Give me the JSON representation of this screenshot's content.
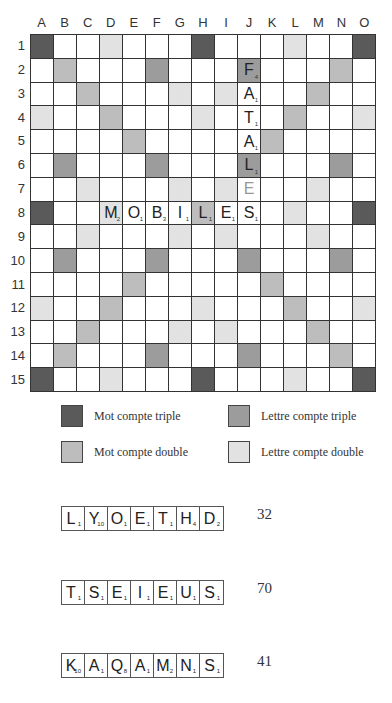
{
  "board": {
    "columns": [
      "A",
      "B",
      "C",
      "D",
      "E",
      "F",
      "G",
      "H",
      "I",
      "J",
      "K",
      "L",
      "M",
      "N",
      "O"
    ],
    "rows": [
      "1",
      "2",
      "3",
      "4",
      "5",
      "6",
      "7",
      "8",
      "9",
      "10",
      "11",
      "12",
      "13",
      "14",
      "15"
    ],
    "premiums": {
      "tw": [
        "A1",
        "H1",
        "O1",
        "A8",
        "O8",
        "A15",
        "H15",
        "O15"
      ],
      "dw": [
        "B2",
        "C3",
        "D4",
        "E5",
        "K11",
        "L12",
        "M13",
        "N14",
        "N2",
        "M3",
        "L4",
        "K5",
        "E11",
        "D12",
        "C13",
        "B14",
        "H8"
      ],
      "tl": [
        "F2",
        "J2",
        "B6",
        "F6",
        "J6",
        "N6",
        "B10",
        "F10",
        "J10",
        "N10",
        "F14",
        "J14"
      ],
      "dl": [
        "D1",
        "L1",
        "G3",
        "I3",
        "A4",
        "H4",
        "O4",
        "C7",
        "G7",
        "I7",
        "M7",
        "D8",
        "L8",
        "C9",
        "G9",
        "I9",
        "M9",
        "A12",
        "H12",
        "O12",
        "G13",
        "I13",
        "D15",
        "L15"
      ]
    },
    "tiles": [
      {
        "cell": "J2",
        "letter": "F",
        "value": "4"
      },
      {
        "cell": "J3",
        "letter": "A",
        "value": "1"
      },
      {
        "cell": "J4",
        "letter": "T",
        "value": "1"
      },
      {
        "cell": "J5",
        "letter": "A",
        "value": "1"
      },
      {
        "cell": "J6",
        "letter": "L",
        "value": "1"
      },
      {
        "cell": "J7",
        "letter": "E",
        "value": "",
        "blank": true
      },
      {
        "cell": "D8",
        "letter": "M",
        "value": "2"
      },
      {
        "cell": "E8",
        "letter": "O",
        "value": "1"
      },
      {
        "cell": "F8",
        "letter": "B",
        "value": "3"
      },
      {
        "cell": "G8",
        "letter": "I",
        "value": "1"
      },
      {
        "cell": "H8",
        "letter": "L",
        "value": "1"
      },
      {
        "cell": "I8",
        "letter": "E",
        "value": "1"
      },
      {
        "cell": "J8",
        "letter": "S",
        "value": "1"
      }
    ]
  },
  "legend": {
    "tw": {
      "label": "Mot compte triple",
      "color": "#5a5a5a"
    },
    "tl": {
      "label": "Lettre compte triple",
      "color": "#9c9c9c"
    },
    "dw": {
      "label": "Mot compte double",
      "color": "#bdbdbd"
    },
    "dl": {
      "label": "Lettre compte double",
      "color": "#e2e2e2"
    }
  },
  "racks": [
    {
      "tiles": [
        {
          "letter": "L",
          "value": "1"
        },
        {
          "letter": "Y",
          "value": "10"
        },
        {
          "letter": "O",
          "value": "1"
        },
        {
          "letter": "E",
          "value": "1"
        },
        {
          "letter": "T",
          "value": "1"
        },
        {
          "letter": "H",
          "value": "4"
        },
        {
          "letter": "D",
          "value": "2"
        }
      ],
      "score": "32"
    },
    {
      "tiles": [
        {
          "letter": "T",
          "value": "1"
        },
        {
          "letter": "S",
          "value": "1"
        },
        {
          "letter": "E",
          "value": "1"
        },
        {
          "letter": "I",
          "value": "1"
        },
        {
          "letter": "E",
          "value": "1"
        },
        {
          "letter": "U",
          "value": "1"
        },
        {
          "letter": "S",
          "value": "1"
        }
      ],
      "score": "70"
    },
    {
      "tiles": [
        {
          "letter": "K",
          "value": "10"
        },
        {
          "letter": "A",
          "value": "1"
        },
        {
          "letter": "Q",
          "value": "8"
        },
        {
          "letter": "A",
          "value": "1"
        },
        {
          "letter": "M",
          "value": "2"
        },
        {
          "letter": "N",
          "value": "1"
        },
        {
          "letter": "S",
          "value": "1"
        }
      ],
      "score": "41"
    }
  ]
}
